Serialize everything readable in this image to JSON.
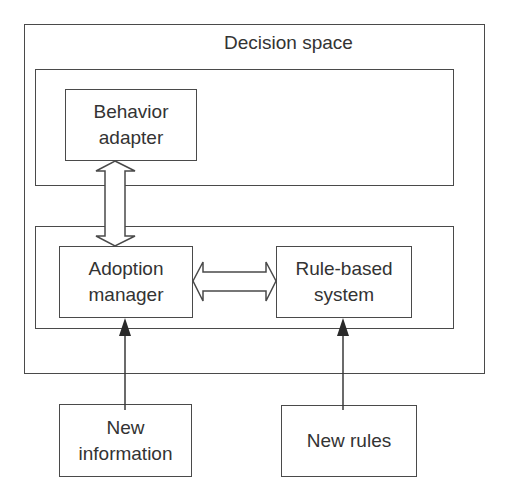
{
  "diagram": {
    "container": {
      "label": "Decision space"
    },
    "nodes": {
      "behavior_adapter": {
        "line1": "Behavior",
        "line2": "adapter"
      },
      "adoption_manager": {
        "line1": "Adoption",
        "line2": "manager"
      },
      "rule_based_system": {
        "line1": "Rule-based",
        "line2": "system"
      },
      "new_information": {
        "line1": "New",
        "line2": "information"
      },
      "new_rules": {
        "line1": "New rules"
      }
    },
    "edges": [
      {
        "from": "behavior_adapter",
        "to": "adoption_manager",
        "type": "bidirectional-hollow"
      },
      {
        "from": "adoption_manager",
        "to": "rule_based_system",
        "type": "bidirectional-hollow"
      },
      {
        "from": "new_information",
        "to": "adoption_manager",
        "type": "solid-arrow"
      },
      {
        "from": "new_rules",
        "to": "rule_based_system",
        "type": "solid-arrow"
      }
    ],
    "colors": {
      "stroke": "#4a4a4a",
      "text": "#333333",
      "background": "#ffffff"
    }
  }
}
